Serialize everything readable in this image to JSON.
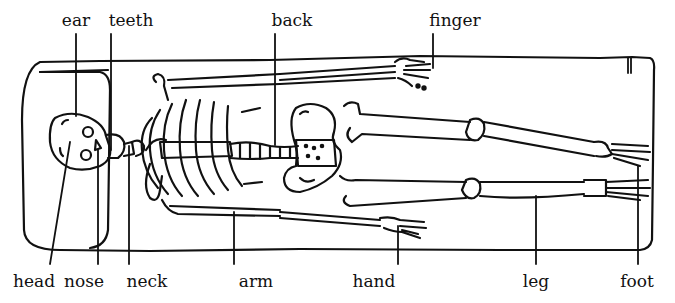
{
  "diagram": {
    "line_color": "#111111",
    "background": "#ffffff",
    "labels_top": [
      {
        "id": "ear",
        "text": "ear",
        "x": 76,
        "y": 12
      },
      {
        "id": "teeth",
        "text": "teeth",
        "x": 131,
        "y": 12
      },
      {
        "id": "back",
        "text": "back",
        "x": 292,
        "y": 12
      },
      {
        "id": "finger",
        "text": "finger",
        "x": 455,
        "y": 12
      }
    ],
    "labels_bottom": [
      {
        "id": "head",
        "text": "head",
        "x": 34,
        "y": 273
      },
      {
        "id": "nose",
        "text": "nose",
        "x": 84,
        "y": 273
      },
      {
        "id": "neck",
        "text": "neck",
        "x": 147,
        "y": 273
      },
      {
        "id": "arm",
        "text": "arm",
        "x": 256,
        "y": 273
      },
      {
        "id": "hand",
        "text": "hand",
        "x": 374,
        "y": 273
      },
      {
        "id": "leg",
        "text": "leg",
        "x": 536,
        "y": 273
      },
      {
        "id": "foot",
        "text": "foot",
        "x": 637,
        "y": 273
      }
    ]
  }
}
